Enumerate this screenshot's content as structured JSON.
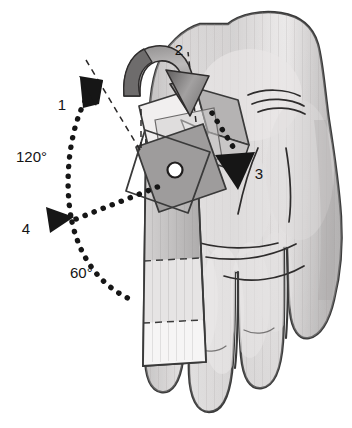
{
  "figure": {
    "background_color": "#ffffff",
    "ink_color": "#141414"
  },
  "labels": {
    "step_1": "1",
    "step_2": "2",
    "step_3": "3",
    "step_4": "4",
    "angle_large": "120°",
    "angle_small": "60°"
  },
  "annotations": [
    {
      "name": "step-1",
      "text": "1",
      "x": 62,
      "y": 110,
      "kind": "step-number"
    },
    {
      "name": "step-2",
      "text": "2",
      "x": 179,
      "y": 55,
      "kind": "step-number"
    },
    {
      "name": "step-3",
      "text": "3",
      "x": 259,
      "y": 174,
      "kind": "step-number"
    },
    {
      "name": "step-4",
      "text": "4",
      "x": 26,
      "y": 232,
      "kind": "step-number"
    },
    {
      "name": "angle-120",
      "text": "120°",
      "x": 18,
      "y": 162,
      "kind": "angle"
    },
    {
      "name": "angle-60",
      "text": "60°",
      "x": 71,
      "y": 277,
      "kind": "angle"
    }
  ],
  "colors": {
    "outline": "#3a3a3a",
    "skin_light": "#eceaea",
    "skin_mid": "#d2d0d0",
    "skin_shadow": "#b4b2b2",
    "splint_light": "#f2f2f2",
    "splint_mid": "#d9d9d9",
    "splint_dark": "#a8a8a8",
    "square_gray": "#9e9e9e",
    "arrow_black": "#161616",
    "dotted": "#161616",
    "pivot_fill": "#ffffff"
  },
  "geometry": {
    "pivot": {
      "x": 175,
      "y": 170,
      "r": 7
    },
    "arc_large_degrees": 120,
    "arc_small_degrees": 60,
    "reference_line": {
      "x1": 140,
      "y1": 148,
      "x2": 86,
      "y2": 60,
      "style": "dashed"
    }
  },
  "parts": {
    "hand": "palmar-hand",
    "splint_strip": "forearm-splint-strip",
    "fold_lines": "dashed-fold-lines",
    "pivot_rivet": "pivot-rivet",
    "curved_arrow": "curved-3d-fold-arrow",
    "dotted_arrow_3": "dotted-straight-arrow",
    "dotted_arc_1": "dotted-rotation-arc-upper",
    "dotted_arc_4": "dotted-rotation-arc-lower"
  }
}
